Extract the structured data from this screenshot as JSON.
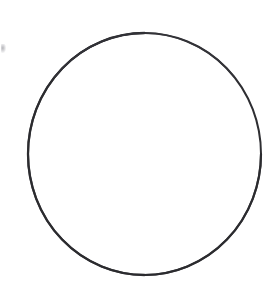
{
  "document": {
    "title": "Circle Outline",
    "background_color": "#ffffff",
    "width": 274,
    "height": 285,
    "caption": ""
  },
  "figure": {
    "name": "circle-outline",
    "shape_type": "ellipse",
    "stroke_color": "#2e2e32",
    "stroke_width": 2,
    "fill": "none",
    "center_x": 144.5,
    "center_y": 154,
    "radius_x": 116.5,
    "radius_y": 121,
    "bounds": {
      "left": 28,
      "top": 33,
      "right": 261,
      "bottom": 275
    }
  },
  "artifacts": {
    "edge_speck": {
      "name": "scan-speck",
      "color": "#787880",
      "x": 1,
      "y": 44,
      "width": 5,
      "height": 9
    }
  }
}
